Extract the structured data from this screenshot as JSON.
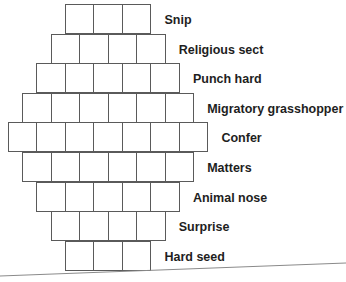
{
  "puzzle": {
    "rows": [
      {
        "clue": "Snip",
        "cells": 3,
        "answer": [
          "",
          "",
          ""
        ]
      },
      {
        "clue": "Religious sect",
        "cells": 4,
        "answer": [
          "",
          "",
          "",
          ""
        ]
      },
      {
        "clue": "Punch hard",
        "cells": 5,
        "answer": [
          "",
          "",
          "",
          "",
          ""
        ]
      },
      {
        "clue": "Migratory grasshopper",
        "cells": 6,
        "answer": [
          "",
          "",
          "",
          "",
          "",
          ""
        ]
      },
      {
        "clue": "Confer",
        "cells": 7,
        "answer": [
          "",
          "",
          "",
          "",
          "",
          "",
          ""
        ]
      },
      {
        "clue": "Matters",
        "cells": 6,
        "answer": [
          "",
          "",
          "",
          "",
          "",
          ""
        ]
      },
      {
        "clue": "Animal nose",
        "cells": 5,
        "answer": [
          "",
          "",
          "",
          "",
          ""
        ]
      },
      {
        "clue": "Surprise",
        "cells": 4,
        "answer": [
          "",
          "",
          "",
          ""
        ]
      },
      {
        "clue": "Hard seed",
        "cells": 3,
        "answer": [
          "",
          "",
          ""
        ]
      }
    ]
  },
  "colors": {
    "grid_line": "#5a5a5a",
    "clue_text": "#1e1e1e",
    "background": "#ffffff"
  }
}
